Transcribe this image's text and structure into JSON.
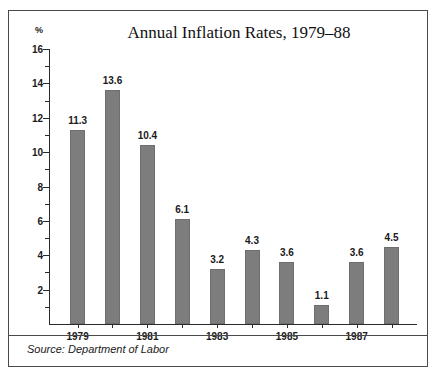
{
  "chart_data": {
    "type": "bar",
    "title": "Annual Inflation Rates, 1979–88",
    "xlabel": "",
    "ylabel": "%",
    "categories": [
      "1979",
      "1980",
      "1981",
      "1982",
      "1983",
      "1984",
      "1985",
      "1986",
      "1987",
      "1988"
    ],
    "values": [
      11.3,
      13.6,
      10.4,
      6.1,
      3.2,
      4.3,
      3.6,
      1.1,
      3.6,
      4.5
    ],
    "value_labels": [
      "11.3",
      "13.6",
      "10.4",
      "6.1",
      "3.2",
      "4.3",
      "3.6",
      "1.1",
      "3.6",
      "4.5"
    ],
    "x_tick_labels": [
      "1979",
      "",
      "1981",
      "",
      "1983",
      "",
      "1985",
      "",
      "1987",
      ""
    ],
    "ylim": [
      0,
      16
    ],
    "y_major_ticks": [
      2,
      4,
      6,
      8,
      10,
      12,
      14,
      16
    ],
    "y_major_tick_labels": [
      "2",
      "4",
      "6",
      "8",
      "10",
      "12",
      "14",
      "16"
    ],
    "y_minor_ticks": [
      1,
      3,
      5,
      7,
      9,
      11,
      13,
      15
    ],
    "grid": false,
    "legend": false,
    "bar_color": "#7d7d7d",
    "axis_color": "#2b2b2b"
  },
  "footer": {
    "source": "Source: Department of Labor"
  }
}
